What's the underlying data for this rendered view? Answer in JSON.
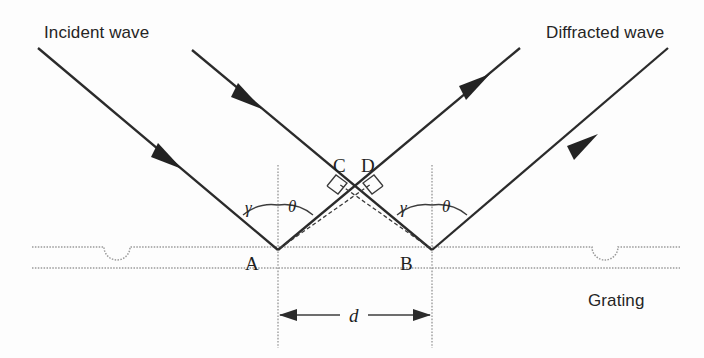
{
  "figure": {
    "background_color": "#fdfdfd",
    "ray_color": "#2b2b2b",
    "guide_color": "#8d8d8d",
    "width": 704,
    "height": 358
  },
  "labels": {
    "incident_wave": "Incident wave",
    "diffracted_wave": "Diffracted wave",
    "grating": "Grating",
    "point_a": "A",
    "point_b": "B",
    "point_c": "C",
    "point_d": "D",
    "spacing": "d",
    "angle_gamma_left": "γ",
    "angle_theta_left": "θ",
    "angle_gamma_right": "γ",
    "angle_theta_right": "θ"
  },
  "geometry": {
    "point_a": {
      "x": 278,
      "y": 250
    },
    "point_b": {
      "x": 432,
      "y": 250
    },
    "point_c": {
      "x": 340,
      "y": 178
    },
    "point_d": {
      "x": 370,
      "y": 178
    },
    "grating_top_y": 247,
    "grating_bottom_y": 268,
    "dimension_y": 315,
    "normal_top_y": 165,
    "normal_bottom_y": 348,
    "groove_centers": [
      117,
      605
    ],
    "groove_radius": 13
  },
  "rays": {
    "incident": [
      {
        "name": "incident-ray-outer",
        "x1": 38,
        "y1": 48,
        "x2": 278,
        "y2": 250,
        "head_t": 0.56
      },
      {
        "name": "incident-ray-inner",
        "x1": 192,
        "y1": 50,
        "x2": 432,
        "y2": 250,
        "head_t": 0.26
      }
    ],
    "diffracted": [
      {
        "name": "diffracted-ray-inner",
        "x1": 278,
        "y1": 250,
        "x2": 520,
        "y2": 48,
        "head_t": 0.82
      },
      {
        "name": "diffracted-ray-outer",
        "x1": 432,
        "y1": 250,
        "x2": 668,
        "y2": 48,
        "head_t": 0.58
      }
    ]
  },
  "annotations": {
    "path_difference_segments": [
      {
        "name": "segment-a-to-d",
        "from": "A",
        "to": "D"
      },
      {
        "name": "segment-b-to-c",
        "from": "B",
        "to": "C"
      }
    ],
    "right_angles": [
      "C",
      "D"
    ],
    "spacing_description": "d"
  }
}
